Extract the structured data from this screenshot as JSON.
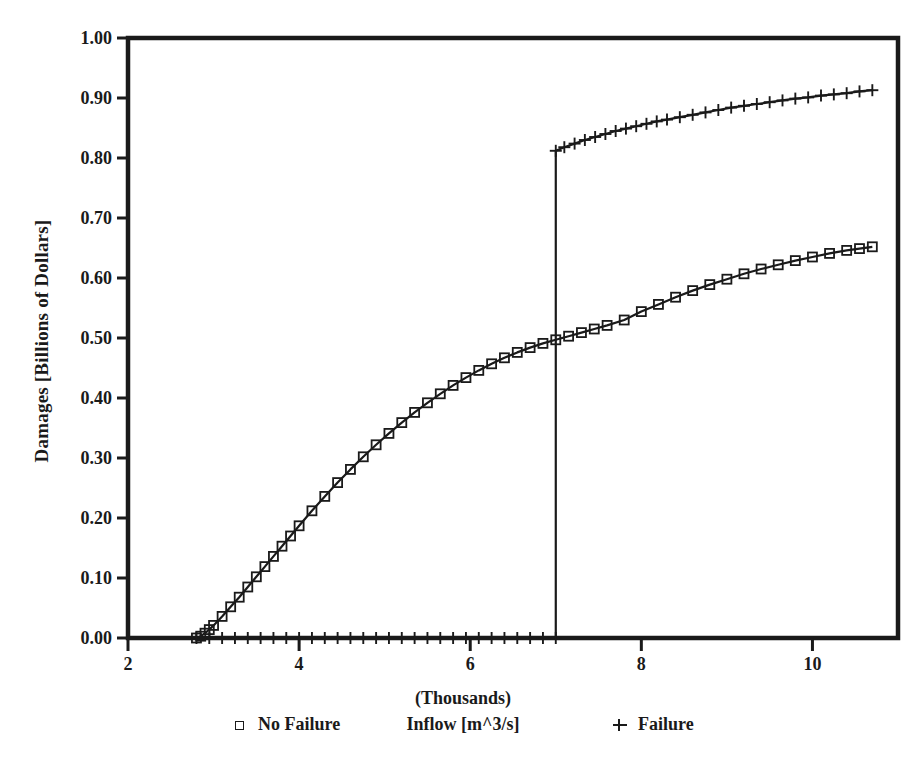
{
  "chart_data": {
    "type": "line",
    "title": "",
    "xlabel": "Inflow [m^3/s]",
    "xlabel_note": "(Thousands)",
    "ylabel": "Damages [Billions of Dollars]",
    "xlim": [
      2,
      11
    ],
    "ylim": [
      0.0,
      1.0
    ],
    "grid": false,
    "legend_position": "below-axis",
    "xticks": [
      2,
      4,
      6,
      8,
      10
    ],
    "xtick_labels": [
      "2",
      "4",
      "6",
      "8",
      "10"
    ],
    "yticks": [
      0.0,
      0.1,
      0.2,
      0.3,
      0.4,
      0.5,
      0.6,
      0.7,
      0.8,
      0.9,
      1.0
    ],
    "ytick_labels": [
      "0.00",
      "0.10",
      "0.20",
      "0.30",
      "0.40",
      "0.50",
      "0.60",
      "0.70",
      "0.80",
      "0.90",
      "1.00"
    ],
    "axis_color": "#1a1a1a",
    "series": [
      {
        "name": "No Failure",
        "marker": "square",
        "color": "#1a1a1a",
        "x": [
          2.8,
          2.85,
          2.9,
          2.95,
          3.0,
          3.1,
          3.2,
          3.3,
          3.4,
          3.5,
          3.6,
          3.7,
          3.8,
          3.9,
          4.0,
          4.15,
          4.3,
          4.45,
          4.6,
          4.75,
          4.9,
          5.05,
          5.2,
          5.35,
          5.5,
          5.65,
          5.8,
          5.95,
          6.1,
          6.25,
          6.4,
          6.55,
          6.7,
          6.85,
          7.0,
          7.15,
          7.3,
          7.45,
          7.6,
          7.8,
          8.0,
          8.2,
          8.4,
          8.6,
          8.8,
          9.0,
          9.2,
          9.4,
          9.6,
          9.8,
          10.0,
          10.2,
          10.4,
          10.55,
          10.7
        ],
        "y": [
          0.0,
          0.003,
          0.008,
          0.014,
          0.021,
          0.036,
          0.052,
          0.068,
          0.085,
          0.102,
          0.119,
          0.136,
          0.153,
          0.17,
          0.187,
          0.212,
          0.236,
          0.259,
          0.281,
          0.302,
          0.322,
          0.341,
          0.359,
          0.376,
          0.392,
          0.407,
          0.421,
          0.434,
          0.446,
          0.457,
          0.467,
          0.476,
          0.484,
          0.491,
          0.497,
          0.503,
          0.509,
          0.515,
          0.521,
          0.53,
          0.544,
          0.556,
          0.568,
          0.579,
          0.589,
          0.598,
          0.607,
          0.615,
          0.622,
          0.629,
          0.635,
          0.641,
          0.646,
          0.649,
          0.652
        ]
      },
      {
        "name": "Failure",
        "marker": "plus",
        "color": "#1a1a1a",
        "x": [
          2.8,
          2.95,
          3.1,
          3.25,
          3.4,
          3.55,
          3.7,
          3.85,
          4.0,
          4.15,
          4.3,
          4.45,
          4.6,
          4.75,
          4.9,
          5.05,
          5.2,
          5.35,
          5.5,
          5.65,
          5.8,
          5.95,
          6.1,
          6.25,
          6.4,
          6.55,
          6.7,
          6.85,
          7.0,
          7.0,
          7.1,
          7.22,
          7.34,
          7.46,
          7.58,
          7.7,
          7.82,
          7.94,
          8.06,
          8.18,
          8.3,
          8.45,
          8.6,
          8.75,
          8.9,
          9.05,
          9.2,
          9.35,
          9.5,
          9.65,
          9.8,
          9.95,
          10.1,
          10.25,
          10.4,
          10.55,
          10.7
        ],
        "y": [
          0.0,
          0.0,
          0.0,
          0.0,
          0.0,
          0.0,
          0.0,
          0.0,
          0.0,
          0.0,
          0.0,
          0.0,
          0.0,
          0.0,
          0.0,
          0.0,
          0.0,
          0.0,
          0.0,
          0.0,
          0.0,
          0.0,
          0.0,
          0.0,
          0.0,
          0.0,
          0.0,
          0.0,
          0.0,
          0.812,
          0.818,
          0.824,
          0.83,
          0.835,
          0.84,
          0.845,
          0.849,
          0.853,
          0.857,
          0.861,
          0.864,
          0.868,
          0.872,
          0.876,
          0.88,
          0.884,
          0.887,
          0.89,
          0.893,
          0.896,
          0.899,
          0.901,
          0.904,
          0.906,
          0.908,
          0.911,
          0.913
        ]
      }
    ]
  },
  "legend": {
    "items": [
      {
        "label": "No Failure",
        "marker": "square"
      },
      {
        "label": "Failure",
        "marker": "plus"
      }
    ]
  }
}
